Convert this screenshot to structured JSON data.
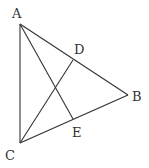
{
  "diagram": {
    "type": "geometry-triangle",
    "points": {
      "A": {
        "label": "A",
        "x": 20,
        "y": 24,
        "lx": 12,
        "ly": 18
      },
      "B": {
        "label": "B",
        "x": 128,
        "y": 95,
        "lx": 132,
        "ly": 101
      },
      "C": {
        "label": "C",
        "x": 20,
        "y": 143,
        "lx": 5,
        "ly": 160
      },
      "D": {
        "label": "D",
        "x": 73,
        "y": 60,
        "lx": 74,
        "ly": 54
      },
      "E": {
        "label": "E",
        "x": 73,
        "y": 119,
        "lx": 72,
        "ly": 137
      }
    },
    "segments": [
      {
        "from": "A",
        "to": "B"
      },
      {
        "from": "B",
        "to": "C"
      },
      {
        "from": "C",
        "to": "A"
      },
      {
        "from": "A",
        "to": "E"
      },
      {
        "from": "C",
        "to": "D"
      }
    ],
    "colors": {
      "stroke": "#333333",
      "background": "#ffffff"
    }
  }
}
